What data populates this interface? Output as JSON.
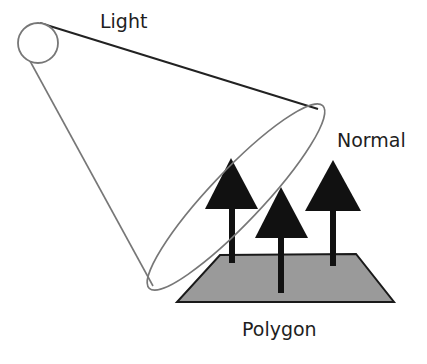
{
  "diagram": {
    "labels": {
      "light": "Light",
      "normal": "Normal",
      "polygon": "Polygon"
    },
    "elements": [
      {
        "id": "light-source",
        "type": "circle",
        "label": "Light"
      },
      {
        "id": "light-cone",
        "type": "cone",
        "description": "cone of light from light source onto polygon"
      },
      {
        "id": "polygon",
        "type": "quadrilateral",
        "label": "Polygon",
        "fill": "#9a9a9a"
      },
      {
        "id": "normal-arrows",
        "type": "arrows",
        "count": 3,
        "label": "Normal",
        "fill": "#111111"
      }
    ],
    "colors": {
      "background": "#ffffff",
      "outline": "#777777",
      "cone_top_edge": "#222222",
      "polygon_fill": "#9a9a9a",
      "polygon_stroke": "#1a1a1a",
      "arrow_fill": "#111111",
      "text": "#1e1e1e"
    }
  }
}
